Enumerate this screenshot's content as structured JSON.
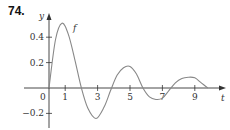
{
  "problem_number": "74.",
  "chart_data": {
    "type": "line",
    "title": "",
    "xlabel": "t",
    "ylabel": "y",
    "curve_label": "f",
    "x_ticks": [
      1,
      3,
      5,
      7,
      9
    ],
    "x_tick_labels": [
      "1",
      "3",
      "5",
      "7",
      "9"
    ],
    "y_ticks": [
      0.4,
      0.2,
      -0.2
    ],
    "y_tick_labels": [
      "0.4",
      "0.2",
      "−0.2"
    ],
    "origin_label": "0",
    "xlim": [
      -2.5,
      11
    ],
    "ylim": [
      -0.3,
      0.58
    ],
    "grid": false,
    "series": [
      {
        "name": "f",
        "x": [
          0,
          0.4,
          0.8,
          1.2,
          1.6,
          2.0,
          2.4,
          2.9,
          3.4,
          3.8,
          4.2,
          4.6,
          5.0,
          5.4,
          5.8,
          6.2,
          6.6,
          7.0,
          7.4,
          7.8,
          8.2,
          8.6,
          9.0,
          9.4,
          9.8
        ],
        "y": [
          0,
          0.38,
          0.51,
          0.42,
          0.22,
          0.0,
          -0.16,
          -0.24,
          -0.15,
          -0.02,
          0.1,
          0.16,
          0.17,
          0.11,
          0.0,
          -0.07,
          -0.09,
          -0.08,
          -0.02,
          0.04,
          0.075,
          0.085,
          0.08,
          0.04,
          0.0
        ],
        "color": "#888888"
      }
    ]
  }
}
